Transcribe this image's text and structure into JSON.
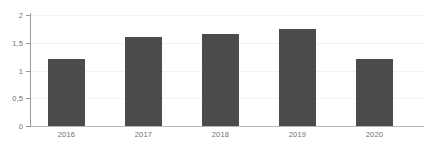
{
  "chart_data": {
    "type": "bar",
    "title": "",
    "subtitle": "",
    "xlabel": "",
    "ylabel": "",
    "categories": [
      "2016",
      "2017",
      "2018",
      "2019",
      "2020"
    ],
    "values": [
      1.2,
      1.6,
      1.65,
      1.75,
      1.2
    ],
    "ylim": [
      0,
      2
    ],
    "yticks": [
      0,
      0.5,
      1,
      1.5,
      2
    ],
    "ytick_labels": [
      "0",
      "0,5",
      "1",
      "1,5",
      "2"
    ],
    "grid": true,
    "legend": false,
    "legend_position": "none",
    "annotations": [],
    "colors": {
      "bar": "#4b4b4b",
      "gridline": "#f2f2f4",
      "axis": "#9b9b9f",
      "baseline": "#b9b9bd",
      "tick_label": "#6f6f73",
      "background": "#ffffff"
    }
  }
}
